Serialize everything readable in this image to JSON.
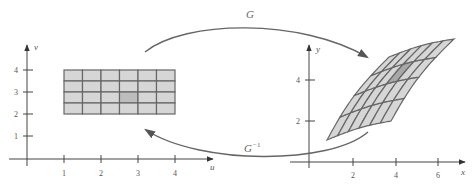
{
  "figure": {
    "colors": {
      "cell_fill": "#d6d6d6",
      "highlight_fill": "#bdbdbd",
      "warped_highlight_fill": "#a8a8a8",
      "grid_line": "#666666",
      "axis": "#444444",
      "arrow": "#666666"
    },
    "maps": {
      "forward_label": "G",
      "inverse_label": "G",
      "inverse_superscript": "−1"
    },
    "left_plane": {
      "horizontal_axis_label": "u",
      "vertical_axis_label": "v",
      "horizontal_ticks": [
        "1",
        "2",
        "3",
        "4"
      ],
      "vertical_ticks": [
        "1",
        "2",
        "3",
        "4"
      ],
      "rectangle": {
        "u_range": [
          1,
          4
        ],
        "v_range": [
          2,
          4
        ],
        "columns": 6,
        "rows": 4,
        "highlight_cell": {
          "col": 3,
          "row": 2
        }
      }
    },
    "right_plane": {
      "horizontal_axis_label": "x",
      "vertical_axis_label": "y",
      "horizontal_ticks": [
        "2",
        "4",
        "6"
      ],
      "vertical_ticks": [
        "2",
        "4"
      ],
      "warped_region": {
        "columns": 6,
        "rows": 4,
        "highlight_cell": {
          "col": 3,
          "row": 2
        }
      }
    }
  }
}
